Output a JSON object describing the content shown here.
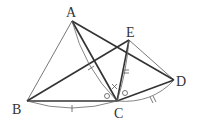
{
  "diagram": {
    "type": "geometry",
    "points": {
      "A": {
        "label": "A",
        "x": 72,
        "y": 21
      },
      "B": {
        "label": "B",
        "x": 27,
        "y": 101
      },
      "C": {
        "label": "C",
        "x": 117,
        "y": 101
      },
      "D": {
        "label": "D",
        "x": 174,
        "y": 80
      },
      "E": {
        "label": "E",
        "x": 129,
        "y": 40
      }
    },
    "segments_thick": [
      "AC",
      "AD",
      "BC",
      "BE",
      "EC",
      "CD"
    ],
    "segments_thin": [
      "AB",
      "ED"
    ],
    "equal_marks": {
      "AC_BC": "single tick",
      "EC_DC": "double tick"
    },
    "angle_marks": [
      "circle at ACB side",
      "circle at ECD side",
      "cross at ACE"
    ]
  }
}
